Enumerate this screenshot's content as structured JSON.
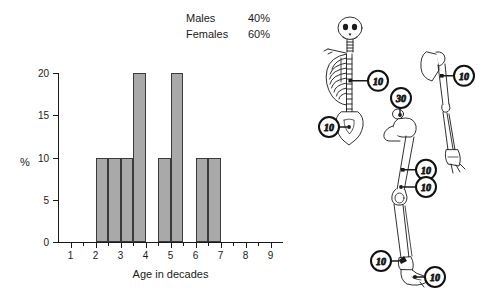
{
  "summary": {
    "rows": [
      {
        "label": "Males",
        "value": "40%"
      },
      {
        "label": "Females",
        "value": "60%"
      }
    ]
  },
  "chart_data": {
    "type": "bar",
    "title": "",
    "xlabel": "Age in decades",
    "ylabel": "%",
    "xlim": [
      0.5,
      9.5
    ],
    "ylim": [
      0,
      20
    ],
    "yticks": [
      "0",
      "5",
      "10",
      "15",
      "20"
    ],
    "ytick_values": [
      0,
      5,
      10,
      15,
      20
    ],
    "xticks": [
      "1",
      "2",
      "3",
      "4",
      "5",
      "6",
      "7",
      "8",
      "9"
    ],
    "xtick_values": [
      1,
      2,
      3,
      4,
      5,
      6,
      7,
      8,
      9
    ],
    "minor_xtick_values": [
      1.5,
      2.5,
      3.5,
      4.5,
      5.5,
      6.5,
      7.5,
      8.5
    ],
    "grid": false,
    "legend": "none",
    "bin_width": 0.5,
    "bins": [
      {
        "start": 2.0,
        "end": 2.5,
        "value": 10
      },
      {
        "start": 2.5,
        "end": 3.0,
        "value": 10
      },
      {
        "start": 3.0,
        "end": 3.5,
        "value": 10
      },
      {
        "start": 3.5,
        "end": 4.0,
        "value": 20
      },
      {
        "start": 4.5,
        "end": 5.0,
        "value": 10
      },
      {
        "start": 5.0,
        "end": 5.5,
        "value": 20
      },
      {
        "start": 6.0,
        "end": 6.5,
        "value": 10
      },
      {
        "start": 6.5,
        "end": 7.0,
        "value": 10
      }
    ],
    "categories": [
      "2.0-2.5",
      "2.5-3.0",
      "3.0-3.5",
      "3.5-4.0",
      "4.5-5.0",
      "5.0-5.5",
      "6.0-6.5",
      "6.5-7.0"
    ],
    "values": [
      10,
      10,
      10,
      20,
      10,
      20,
      10,
      10
    ],
    "bar_color": "#a9a9a9",
    "bar_edge_color": "#3a3a3a"
  },
  "skeleton": {
    "markers": [
      {
        "id": "spine",
        "label": "10"
      },
      {
        "id": "pelvis",
        "label": "10"
      },
      {
        "id": "humerus",
        "label": "10"
      },
      {
        "id": "femoral-neck",
        "label": "30"
      },
      {
        "id": "femur-shaft",
        "label": "10"
      },
      {
        "id": "distal-femur",
        "label": "10"
      },
      {
        "id": "distal-tibia",
        "label": "10"
      },
      {
        "id": "foot",
        "label": "10"
      }
    ]
  }
}
